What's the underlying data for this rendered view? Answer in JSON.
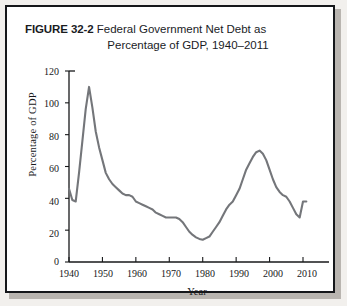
{
  "figure": {
    "number_label": "FIGURE 32-2",
    "title_line1": "Federal Government Net Debt as",
    "title_line2": "Percentage of GDP, 1940–2011"
  },
  "colors": {
    "line": "#74767a",
    "axis": "#17181a",
    "frame": "#15171a",
    "page_background": "#f2f0ed",
    "plot_background": "#ffffff"
  },
  "chart_data": {
    "type": "line",
    "title": "Federal Government Net Debt as Percentage of GDP, 1940–2011",
    "xlabel": "Year",
    "ylabel": "Percentage of GDP",
    "xlim": [
      1938,
      2013
    ],
    "ylim": [
      0,
      120
    ],
    "ytick_values": [
      0,
      20,
      40,
      60,
      80,
      100,
      120
    ],
    "ytick_labels": [
      "0",
      "20",
      "40",
      "60",
      "80",
      "100",
      "120"
    ],
    "xtick_values": [
      1940,
      1950,
      1960,
      1970,
      1980,
      1990,
      2000,
      2010
    ],
    "xtick_labels": [
      "1940",
      "1950",
      "1960",
      "1970",
      "1980",
      "1990",
      "2000",
      "2010"
    ],
    "grid": false,
    "legend": false,
    "series": [
      {
        "name": "Federal Government Net Debt (% of GDP)",
        "x": [
          1940,
          1941,
          1942,
          1943,
          1944,
          1945,
          1946,
          1947,
          1948,
          1949,
          1950,
          1951,
          1952,
          1953,
          1954,
          1955,
          1956,
          1957,
          1958,
          1959,
          1960,
          1961,
          1962,
          1963,
          1964,
          1965,
          1966,
          1967,
          1968,
          1969,
          1970,
          1971,
          1972,
          1973,
          1974,
          1975,
          1976,
          1977,
          1978,
          1979,
          1980,
          1981,
          1982,
          1983,
          1984,
          1985,
          1986,
          1987,
          1988,
          1989,
          1990,
          1991,
          1992,
          1993,
          1994,
          1995,
          1996,
          1997,
          1998,
          1999,
          2000,
          2001,
          2002,
          2003,
          2004,
          2005,
          2006,
          2007,
          2008,
          2009,
          2010,
          2011
        ],
        "y": [
          46,
          39,
          38,
          56,
          76,
          96,
          110,
          97,
          82,
          72,
          64,
          56,
          52,
          49,
          47,
          45,
          43,
          42,
          42,
          41,
          38,
          37,
          36,
          35,
          34,
          33,
          31,
          30,
          29,
          28,
          28,
          28,
          28,
          27,
          25,
          22,
          19,
          17,
          15.5,
          14.5,
          14,
          15,
          16,
          19,
          22,
          25,
          29,
          33,
          36,
          38,
          42,
          46,
          52,
          58,
          62,
          66,
          69,
          70,
          68,
          64,
          58,
          52,
          47,
          44,
          42,
          41,
          38,
          34,
          30,
          28,
          38,
          38
        ]
      }
    ],
    "annotations": [
      {
        "text": "Peak ≈110% of GDP in 1946 (World War II)",
        "x": 1946,
        "y": 110
      },
      {
        "text": "Trough ≈14% of GDP in 1974–1975",
        "x": 1975,
        "y": 14
      },
      {
        "text": "Secondary peak ≈70% of GDP in 1996–1997",
        "x": 1996,
        "y": 70
      },
      {
        "text": "Sharp rise at end of series, 2009–2011",
        "x": 2010,
        "y": 38
      }
    ]
  }
}
